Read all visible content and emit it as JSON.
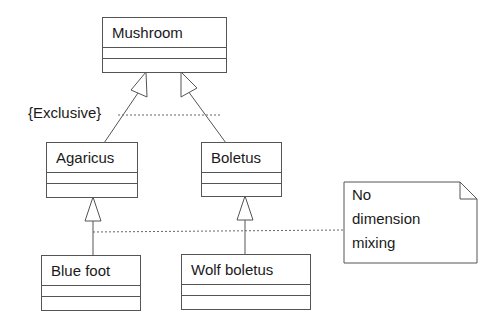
{
  "diagram": {
    "type": "uml-class-diagram",
    "classes": [
      {
        "id": "mushroom",
        "name": "Mushroom"
      },
      {
        "id": "agaricus",
        "name": "Agaricus"
      },
      {
        "id": "boletus",
        "name": "Boletus"
      },
      {
        "id": "bluefoot",
        "name": "Blue foot"
      },
      {
        "id": "wolfboletus",
        "name": "Wolf boletus"
      }
    ],
    "generalizations": [
      {
        "child": "Agaricus",
        "parent": "Mushroom"
      },
      {
        "child": "Boletus",
        "parent": "Mushroom"
      },
      {
        "child": "Blue foot",
        "parent": "Agaricus"
      },
      {
        "child": "Wolf boletus",
        "parent": "Boletus"
      }
    ],
    "constraint": {
      "label": "{Exclusive}"
    },
    "note": {
      "lines": [
        "No",
        "dimension",
        "mixing"
      ]
    }
  }
}
